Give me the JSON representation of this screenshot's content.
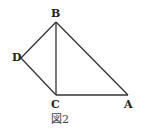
{
  "figure": {
    "caption": "図2",
    "points": {
      "A": {
        "label": "A",
        "x": 128,
        "y": 95
      },
      "B": {
        "label": "B",
        "x": 56,
        "y": 22
      },
      "C": {
        "label": "C",
        "x": 56,
        "y": 95
      },
      "D": {
        "label": "D",
        "x": 21,
        "y": 58
      }
    },
    "segments": [
      [
        "B",
        "C"
      ],
      [
        "C",
        "A"
      ],
      [
        "A",
        "B"
      ],
      [
        "B",
        "D"
      ],
      [
        "D",
        "C"
      ]
    ],
    "stroke_color": "#333333"
  }
}
